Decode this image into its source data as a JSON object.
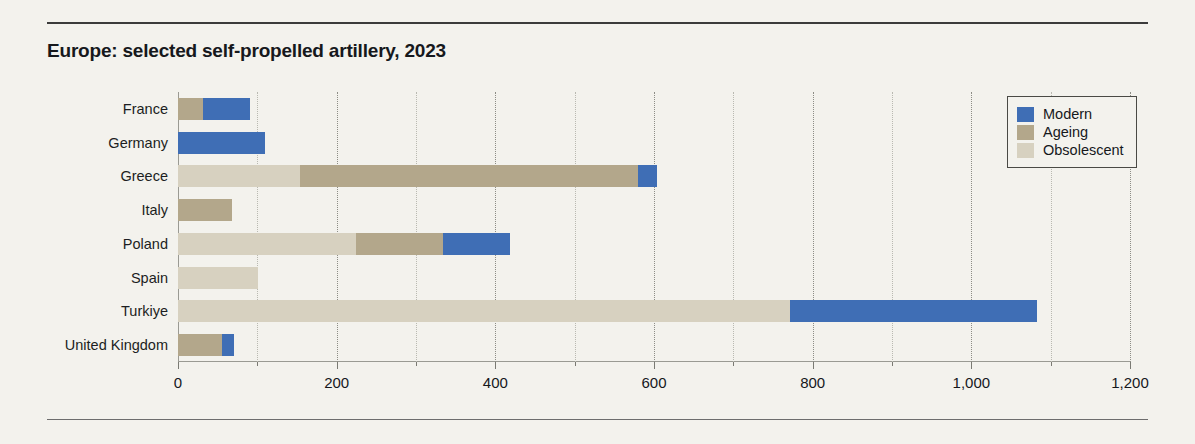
{
  "chart_data": {
    "type": "bar",
    "orientation": "horizontal",
    "stacked": true,
    "title": "Europe: selected self-propelled artillery, 2023",
    "xlabel": "",
    "ylabel": "",
    "xlim": [
      0,
      1200
    ],
    "grid": true,
    "legend_position": "top-right",
    "categories": [
      "France",
      "Germany",
      "Greece",
      "Italy",
      "Poland",
      "Spain",
      "Turkiye",
      "United Kingdom"
    ],
    "series": [
      {
        "name": "Modern",
        "color": "#3f6eb5",
        "values": [
          59,
          110,
          24,
          0,
          84,
          0,
          311,
          15
        ]
      },
      {
        "name": "Ageing",
        "color": "#b3a78b",
        "values": [
          32,
          0,
          426,
          68,
          110,
          0,
          0,
          55
        ]
      },
      {
        "name": "Obsolescent",
        "color": "#d7d1c0",
        "values": [
          0,
          0,
          154,
          0,
          224,
          101,
          772,
          0
        ]
      }
    ],
    "stack_order": [
      "Obsolescent",
      "Ageing",
      "Modern"
    ],
    "totals": [
      91,
      110,
      604,
      68,
      418,
      101,
      1083,
      70
    ],
    "xticks": [
      0,
      200,
      400,
      600,
      800,
      1000,
      1200
    ],
    "xtick_labels": [
      "0",
      "200",
      "400",
      "600",
      "800",
      "1,000",
      "1,200"
    ],
    "xticks_minor": [
      100,
      300,
      500,
      700,
      900,
      1100
    ]
  },
  "legend": {
    "items": [
      {
        "label": "Modern",
        "color": "#3f6eb5"
      },
      {
        "label": "Ageing",
        "color": "#b3a78b"
      },
      {
        "label": "Obsolescent",
        "color": "#d7d1c0"
      }
    ]
  }
}
